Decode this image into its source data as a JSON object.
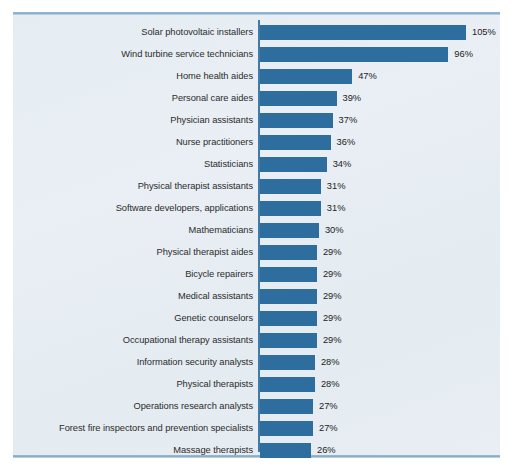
{
  "figure": {
    "panel_bg": "#e7eef3",
    "bar_color": "#2d6e9e",
    "rule_color": "#7fa8c6",
    "axis_color": "#3f7ba6",
    "label_color": "#2b2b2b"
  },
  "chart_data": {
    "type": "bar",
    "orientation": "horizontal",
    "title": "",
    "subtitle": "",
    "xlabel": "",
    "ylabel": "",
    "grid": false,
    "legend": null,
    "xlim": [
      0,
      105
    ],
    "value_suffix": "%",
    "categories": [
      "Solar photovoltaic installers",
      "Wind turbine service technicians",
      "Home health aides",
      "Personal care aides",
      "Physician assistants",
      "Nurse practitioners",
      "Statisticians",
      "Physical therapist assistants",
      "Software developers, applications",
      "Mathematicians",
      "Physical therapist aides",
      "Bicycle repairers",
      "Medical assistants",
      "Genetic counselors",
      "Occupational therapy assistants",
      "Information security analysts",
      "Physical therapists",
      "Operations research analysts",
      "Forest fire inspectors and prevention specialists",
      "Massage therapists"
    ],
    "values": [
      105,
      96,
      47,
      39,
      37,
      36,
      34,
      31,
      31,
      30,
      29,
      29,
      29,
      29,
      29,
      28,
      28,
      27,
      27,
      26
    ],
    "value_labels": [
      "105%",
      "96%",
      "47%",
      "39%",
      "37%",
      "36%",
      "34%",
      "31%",
      "31%",
      "30%",
      "29%",
      "29%",
      "29%",
      "29%",
      "29%",
      "28%",
      "28%",
      "27%",
      "27%",
      "26%"
    ]
  }
}
